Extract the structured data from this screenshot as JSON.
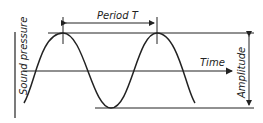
{
  "diagram": {
    "labels": {
      "period": "Period T",
      "time": "Time",
      "y_axis": "Sound pressure",
      "amplitude": "Amplitude"
    },
    "colors": {
      "line": "#222222",
      "background": "#ffffff"
    }
  }
}
